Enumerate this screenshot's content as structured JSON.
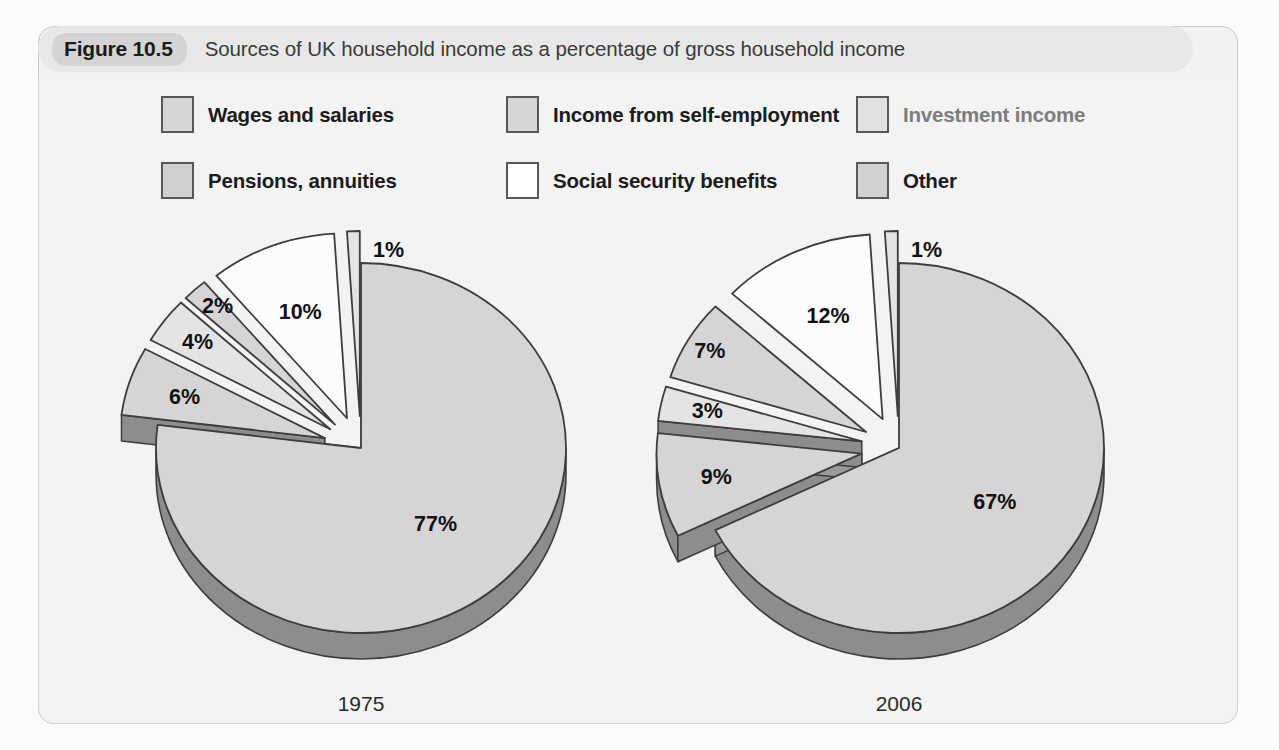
{
  "figure": {
    "badge": "Figure 10.5",
    "title": "Sources of UK household income as a percentage of gross household income"
  },
  "legend": {
    "items": [
      {
        "label": "Wages and salaries",
        "color": "#d6d6d6",
        "muted": false
      },
      {
        "label": "Income from self-employment",
        "color": "#d6d6d6",
        "muted": false
      },
      {
        "label": "Investment income",
        "color": "#e2e2e2",
        "muted": true
      },
      {
        "label": "Pensions, annuities",
        "color": "#d0d0d0",
        "muted": false
      },
      {
        "label": "Social security benefits",
        "color": "#ffffff",
        "muted": false
      },
      {
        "label": "Other",
        "color": "#d2d2d2",
        "muted": false
      }
    ]
  },
  "pies": {
    "left": {
      "year": "1975",
      "labels": [
        "77%",
        "6%",
        "4%",
        "2%",
        "10%",
        "1%"
      ]
    },
    "right": {
      "year": "2006",
      "labels": [
        "67%",
        "9%",
        "3%",
        "7%",
        "12%",
        "1%"
      ]
    }
  },
  "colors": {
    "pie_top": "#d5d5d5",
    "pie_top_light": "#e4e4e4",
    "pie_top_white": "#fcfcfc",
    "pie_side": "#8d8d8d",
    "pie_side_light": "#9a9a9a",
    "outline": "#3d3d3d",
    "panel_bg": "#f3f3f3",
    "header_bg": "#e8e8e8",
    "badge_bg": "#d4d4d4"
  },
  "chart_data": [
    {
      "type": "pie",
      "title": "1975",
      "categories": [
        "Wages and salaries",
        "Income from self-employment",
        "Investment income",
        "Pensions, annuities",
        "Social security benefits",
        "Other"
      ],
      "values": [
        77,
        6,
        4,
        2,
        10,
        1
      ],
      "unit": "%",
      "exploded": [
        false,
        true,
        true,
        true,
        true,
        true
      ],
      "legend_position": "top",
      "grid": false
    },
    {
      "type": "pie",
      "title": "2006",
      "categories": [
        "Wages and salaries",
        "Income from self-employment",
        "Investment income",
        "Pensions, annuities",
        "Social security benefits",
        "Other"
      ],
      "values": [
        67,
        9,
        3,
        7,
        12,
        1
      ],
      "unit": "%",
      "exploded": [
        false,
        true,
        true,
        true,
        true,
        true
      ],
      "legend_position": "top",
      "grid": false
    }
  ]
}
